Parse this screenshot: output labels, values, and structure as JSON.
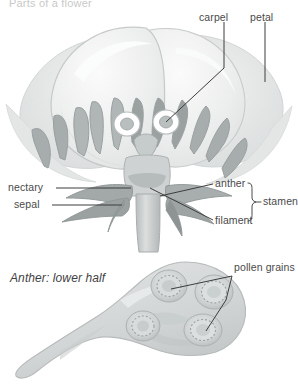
{
  "figure": {
    "title": "Parts of a flower",
    "panels": [
      {
        "id": "flower",
        "caption": ""
      },
      {
        "id": "anther-section",
        "caption": "Anther: lower half"
      }
    ]
  },
  "labels": {
    "carpel": "carpel",
    "petal": "petal",
    "nectary": "nectary",
    "sepal": "sepal",
    "anther": "anther",
    "filament": "filament",
    "stamen": "stamen",
    "pollen_grains": "pollen grains",
    "anther_lower_half": "Anther: lower half"
  },
  "colors": {
    "background": "#ffffff",
    "petal_fill": "#e9eaea",
    "petal_light": "#f4f5f5",
    "petal_edge": "#cfd2d2",
    "stamen_fill": "#a9aeae",
    "stamen_dark": "#8d9393",
    "sepal_fill": "#9fa5a5",
    "receptacle": "#cdd0d0",
    "carpel_ring": "#ffffff",
    "anther_body": "#d7d9d9",
    "pollen_sac": "#c3c7c7",
    "leader_line": "#3d3d3d",
    "text": "#4a4a4a",
    "title_text": "#c9c9c9"
  },
  "icons": {
    "brace": "curly-brace-icon"
  }
}
